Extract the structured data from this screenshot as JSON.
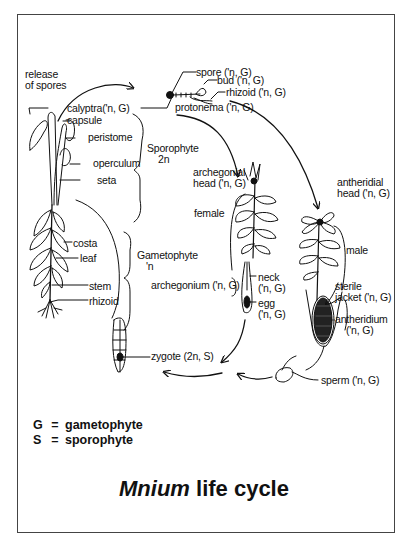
{
  "diagram": {
    "title": {
      "genus": "Mnium",
      "rest": " life cycle"
    },
    "legend": [
      {
        "key": "G",
        "eq": "=",
        "value": "gametophyte"
      },
      {
        "key": "S",
        "eq": "=",
        "value": "sporophyte"
      }
    ],
    "labels": {
      "release_of_spores_1": "release",
      "release_of_spores_2": "of spores",
      "calyptra": "calyptra('n, G)",
      "capsule": "capsule",
      "peristome": "peristome",
      "operculum": "operculum",
      "seta": "seta",
      "sporophyte": "Sporophyte",
      "sporophyte_ploidy": "2n",
      "costa": "costa",
      "leaf": "leaf",
      "stem": "stem",
      "rhizoid_plant": "rhizoid",
      "gametophyte": "Gametophyte",
      "gametophyte_ploidy": "'n",
      "spore": "spore ('n, G)",
      "bud": "bud ('n, G)",
      "rhizoid_protonema": "rhizoid ('n, G)",
      "protonema": "protonema ('n, G)",
      "archegonial_head_1": "archegonial",
      "archegonial_head_2": "head ('n, G)",
      "female": "female",
      "antheridial_head_1": "antheridial",
      "antheridial_head_2": "head ('n, G)",
      "male": "male",
      "archegonium": "archegonium ('n, G)",
      "neck_1": "neck",
      "neck_2": "('n, G)",
      "egg_1": "egg",
      "egg_2": "('n, G)",
      "sterile_jacket_1": "sterile",
      "sterile_jacket_2": "jacket ('n, G)",
      "antheridium_1": "antheridium",
      "antheridium_2": "('n, G)",
      "zygote": "zygote (2n, S)",
      "sperm": "sperm ('n, G)"
    }
  }
}
